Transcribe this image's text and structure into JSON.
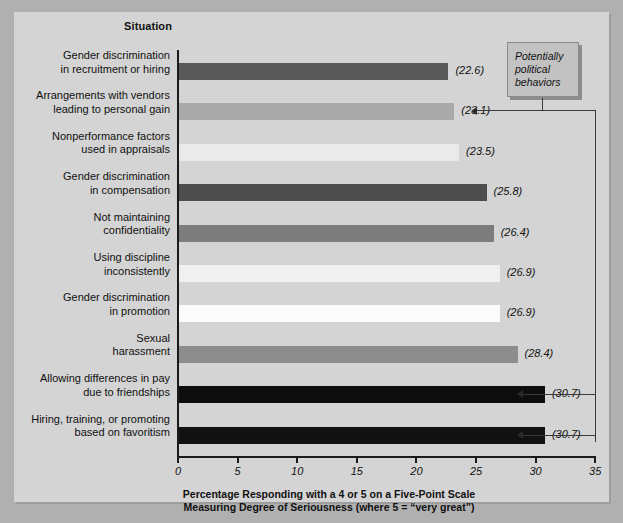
{
  "chart_data": {
    "type": "bar",
    "orientation": "horizontal",
    "title": "",
    "ylabel": "Situation",
    "xlabel": "Percentage Responding with a 4 or 5 on a Five-Point Scale Measuring Degree of Seriousness (where 5 = \"very great\")",
    "xlabel_lines": [
      "Percentage Responding with a 4 or 5 on a Five-Point Scale",
      "Measuring Degree of Seriousness (where 5 = “very great”)"
    ],
    "xlim": [
      0,
      35
    ],
    "xticks": [
      0,
      5,
      10,
      15,
      20,
      25,
      30,
      35
    ],
    "xtick_labels": [
      "0",
      "5",
      "10",
      "15",
      "20",
      "25",
      "30",
      "35"
    ],
    "grid": false,
    "legend": "none",
    "categories": [
      "Gender discrimination in recruitment or hiring",
      "Arrangements with vendors leading to personal gain",
      "Nonperformance factors used in appraisals",
      "Gender discrimination in compensation",
      "Not maintaining confidentiality",
      "Using discipline inconsistently",
      "Gender discrimination in promotion",
      "Sexual harassment",
      "Allowing differences in pay due to friendships",
      "Hiring, training, or promoting based on favoritism"
    ],
    "values": [
      22.6,
      23.1,
      23.5,
      25.8,
      26.4,
      26.9,
      26.9,
      28.4,
      30.7,
      30.7
    ],
    "value_labels": [
      "(22.6)",
      "(23.1)",
      "(23.5)",
      "(25.8)",
      "(26.4)",
      "(26.9)",
      "(26.9)",
      "(28.4)",
      "(30.7)",
      "(30.7)"
    ],
    "bar_colors": [
      "#585858",
      "#a9a9a9",
      "#eaeaea",
      "#4e4e4e",
      "#7d7d7d",
      "#f0f0f0",
      "#fbfbfb",
      "#8d8d8d",
      "#0d0d0d",
      "#111111"
    ],
    "annotations": [
      {
        "text": "Potentially political behaviors",
        "lines": [
          "Potentially",
          "political",
          "behaviors"
        ],
        "points_to": [
          "Arrangements with vendors leading to personal gain",
          "Allowing differences in pay due to friendships",
          "Hiring, training, or promoting based on favoritism"
        ]
      }
    ]
  },
  "rows": [
    {
      "label_line1": "Gender discrimination",
      "label_line2": "in recruitment or hiring",
      "value": "(22.6)"
    },
    {
      "label_line1": "Arrangements with vendors",
      "label_line2": "leading to personal gain",
      "value": "(23.1)"
    },
    {
      "label_line1": "Nonperformance factors",
      "label_line2": "used in appraisals",
      "value": "(23.5)"
    },
    {
      "label_line1": "Gender discrimination",
      "label_line2": "in compensation",
      "value": "(25.8)"
    },
    {
      "label_line1": "Not maintaining",
      "label_line2": "confidentiality",
      "value": "(26.4)"
    },
    {
      "label_line1": "Using discipline",
      "label_line2": "inconsistently",
      "value": "(26.9)"
    },
    {
      "label_line1": "Gender discrimination",
      "label_line2": "in promotion",
      "value": "(26.9)"
    },
    {
      "label_line1": "Sexual",
      "label_line2": "harassment",
      "value": "(28.4)"
    },
    {
      "label_line1": "Allowing differences in pay",
      "label_line2": "due to friendships",
      "value": "(30.7)"
    },
    {
      "label_line1": "Hiring, training, or promoting",
      "label_line2": "based on favoritism",
      "value": "(30.7)"
    }
  ],
  "axis": {
    "y_header": "Situation",
    "tick0": "0",
    "tick1": "5",
    "tick2": "10",
    "tick3": "15",
    "tick4": "20",
    "tick5": "25",
    "tick6": "30",
    "tick7": "35",
    "caption_line1": "Percentage Responding with a 4 or 5 on a Five-Point Scale",
    "caption_line2": "Measuring Degree of Seriousness (where 5 = “very great”)"
  },
  "callout": {
    "line1": "Potentially",
    "line2": "political",
    "line3": "behaviors"
  },
  "colors": {
    "page_background": "#b0b0b0",
    "panel_background": "#d4d4d4",
    "axis": "#1a1a1a",
    "connector": "#3a3a3a",
    "callout_fill": "#c2c2c2"
  }
}
